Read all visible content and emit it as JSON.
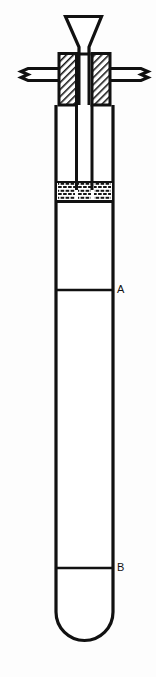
{
  "figure": {
    "background_color": "#fdfdfd",
    "line_color": "#111111",
    "fill_color": "#ffffff",
    "hatch_color": "#1a1a1a"
  },
  "labels": {
    "mark_a": "A",
    "mark_b": "B"
  },
  "parts": {
    "funnel": "funnel",
    "stopper": "hatched-stopper",
    "bench_bar": "support-bar-with-break-symbols",
    "inner_tube_left": "inner-tube-left",
    "inner_tube_right": "inner-tube-right",
    "granular_bed": "granular-liquid-bed",
    "outer_tube": "outer-test-tube",
    "rounded_base": "rounded-tube-base",
    "level_line_a": "level-line-a",
    "level_line_b": "level-line-b"
  }
}
